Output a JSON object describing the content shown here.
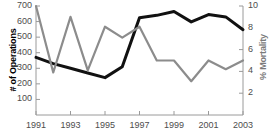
{
  "chart_data": {
    "type": "line",
    "title": "",
    "xlabel": "",
    "ylabel": "# of Operations",
    "y2label": "% Mortality",
    "x": [
      1991,
      1992,
      1993,
      1994,
      1995,
      1996,
      1997,
      1998,
      1999,
      2000,
      2001,
      2002,
      2003
    ],
    "xticks": [
      1991,
      1993,
      1995,
      1997,
      1999,
      2001,
      2003
    ],
    "xtick_labels": [
      "1991",
      "1993",
      "1995",
      "1997",
      "1999",
      "2001",
      "2003"
    ],
    "xlim": [
      1991,
      2003
    ],
    "yticks": [
      100,
      200,
      300,
      400,
      500,
      600,
      700
    ],
    "ytick_labels": [
      "100",
      "200",
      "300",
      "400",
      "500",
      "600",
      "700"
    ],
    "ylim": [
      0,
      700
    ],
    "y2ticks": [
      2,
      4,
      6,
      8,
      10
    ],
    "y2tick_labels": [
      "2",
      "4",
      "6",
      "8",
      "10"
    ],
    "y2lim": [
      0,
      10
    ],
    "grid": false,
    "legend": "none",
    "series": [
      {
        "name": "# of Operations",
        "axis": "left",
        "color": "#111111",
        "values": [
          370,
          330,
          300,
          270,
          240,
          310,
          625,
          640,
          665,
          598,
          645,
          630,
          548
        ]
      },
      {
        "name": "% Mortality",
        "axis": "right",
        "color": "#8c8c8c",
        "values": [
          10.0,
          3.9,
          9.0,
          4.1,
          8.1,
          7.1,
          8.1,
          5.0,
          5.0,
          3.1,
          5.0,
          4.2,
          5.0
        ]
      }
    ]
  },
  "axes": {
    "left_title": "# of Operations",
    "right_title": "% Mortality"
  }
}
